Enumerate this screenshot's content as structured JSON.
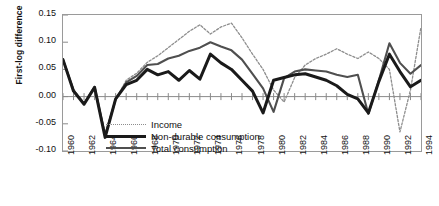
{
  "chart_data": {
    "type": "line",
    "title": "",
    "xlabel": "",
    "ylabel": "First-log difference",
    "ylim": [
      -0.1,
      0.15
    ],
    "yticks": [
      0.15,
      0.1,
      0.05,
      0.0,
      -0.05,
      -0.1
    ],
    "ytick_labels": [
      "0.15",
      "0.10",
      "0.05",
      "0.00",
      "-0.05",
      "-0.10"
    ],
    "xlim": [
      1960,
      1994
    ],
    "xticks": [
      1960,
      1962,
      1964,
      1966,
      1968,
      1970,
      1972,
      1974,
      1976,
      1978,
      1980,
      1982,
      1984,
      1986,
      1988,
      1990,
      1992,
      1994
    ],
    "xtick_labels": [
      "1960",
      "1962",
      "1964",
      "1966",
      "1968",
      "1970",
      "1972",
      "1974",
      "1976",
      "1978",
      "1980",
      "1982",
      "1984",
      "1986",
      "1988",
      "1990",
      "1992",
      "1994"
    ],
    "grid": false,
    "zero_line": true,
    "legend_position": "inside-lower-left",
    "x": [
      1960,
      1961,
      1962,
      1963,
      1964,
      1965,
      1966,
      1967,
      1968,
      1969,
      1970,
      1971,
      1972,
      1973,
      1974,
      1975,
      1976,
      1977,
      1978,
      1979,
      1980,
      1981,
      1982,
      1983,
      1984,
      1985,
      1986,
      1987,
      1988,
      1989,
      1990,
      1991,
      1992,
      1993,
      1994
    ],
    "series": [
      {
        "name": "Income",
        "color": "#8d8d8d",
        "style": "dotted",
        "width": 1.3,
        "values": [
          0.068,
          0.013,
          -0.012,
          0.018,
          -0.068,
          -0.005,
          0.03,
          0.043,
          0.063,
          0.075,
          0.09,
          0.105,
          0.12,
          0.132,
          0.115,
          0.128,
          0.135,
          0.108,
          0.078,
          0.05,
          0.012,
          -0.01,
          0.035,
          0.058,
          0.07,
          0.078,
          0.088,
          0.078,
          0.07,
          0.082,
          0.07,
          0.05,
          -0.065,
          0.012,
          0.128
        ],
        "values_note": "thin light-gray dotted upper envelope"
      },
      {
        "name": "Non-durable consumption",
        "color": "#1a1a1a",
        "style": "solid",
        "width": 3.0,
        "values": [
          0.068,
          0.01,
          -0.014,
          0.017,
          -0.075,
          -0.004,
          0.022,
          0.03,
          0.05,
          0.04,
          0.046,
          0.03,
          0.048,
          0.032,
          0.078,
          0.062,
          0.05,
          0.03,
          0.01,
          -0.03,
          0.03,
          0.035,
          0.04,
          0.042,
          0.036,
          0.03,
          0.02,
          0.004,
          -0.004,
          -0.03,
          0.028,
          0.078,
          0.046,
          0.018,
          0.03
        ],
        "values_note": "thick black lower series"
      },
      {
        "name": "Total consumption",
        "color": "#4f4f4f",
        "style": "solid",
        "width": 2.1,
        "values": [
          0.068,
          0.012,
          -0.013,
          0.018,
          -0.072,
          -0.005,
          0.026,
          0.038,
          0.058,
          0.06,
          0.07,
          0.075,
          0.084,
          0.09,
          0.1,
          0.092,
          0.085,
          0.068,
          0.042,
          0.015,
          -0.028,
          0.034,
          0.046,
          0.05,
          0.048,
          0.046,
          0.04,
          0.036,
          0.04,
          -0.032,
          0.03,
          0.098,
          0.062,
          0.042,
          0.058
        ],
        "values_note": "medium dark-gray middle series"
      }
    ]
  },
  "legend": {
    "items": [
      {
        "label": "Income",
        "key": "income"
      },
      {
        "label": "Non-durable consumption",
        "key": "nondurable"
      },
      {
        "label": "Total consumption",
        "key": "total"
      }
    ]
  }
}
